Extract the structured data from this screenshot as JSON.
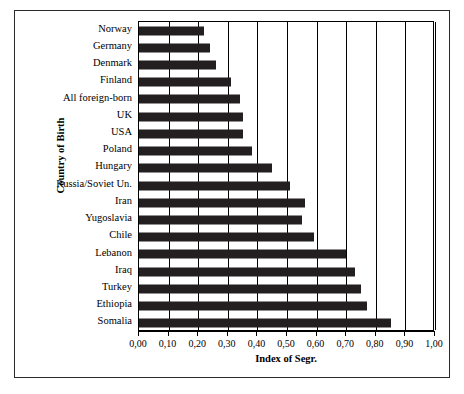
{
  "chart_data": {
    "type": "bar",
    "orientation": "horizontal",
    "title": "",
    "xlabel": "Index of Segr.",
    "ylabel": "Country of Birth",
    "xlim": [
      0.0,
      1.0
    ],
    "xticks": [
      "0,00",
      "0,10",
      "0,20",
      "0,30",
      "0,40",
      "0,50",
      "0,60",
      "0,70",
      "0,80",
      "0,90",
      "1,00"
    ],
    "xtick_values": [
      0.0,
      0.1,
      0.2,
      0.3,
      0.4,
      0.5,
      0.6,
      0.7,
      0.8,
      0.9,
      1.0
    ],
    "grid": true,
    "grid_axis": "x",
    "legend": "none",
    "bar_color": "#231f20",
    "categories": [
      "Norway",
      "Germany",
      "Denmark",
      "Finland",
      "All foreign-born",
      "UK",
      "USA",
      "Poland",
      "Hungary",
      "Russia/Soviet Un.",
      "Iran",
      "Yugoslavia",
      "Chile",
      "Lebanon",
      "Iraq",
      "Turkey",
      "Ethiopia",
      "Somalia"
    ],
    "values": [
      0.22,
      0.24,
      0.26,
      0.31,
      0.34,
      0.35,
      0.35,
      0.38,
      0.45,
      0.51,
      0.56,
      0.55,
      0.59,
      0.7,
      0.73,
      0.75,
      0.77,
      0.85
    ]
  }
}
